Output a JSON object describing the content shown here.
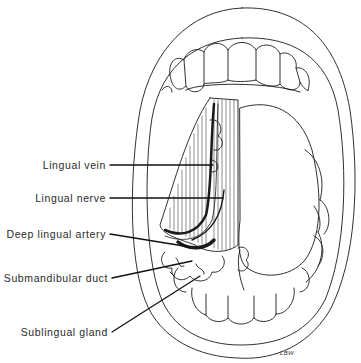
{
  "figure": {
    "labels": [
      {
        "id": "lingual-vein",
        "text": "Lingual vein"
      },
      {
        "id": "lingual-nerve",
        "text": "Lingual nerve"
      },
      {
        "id": "deep-lingual-artery",
        "text": "Deep lingual artery"
      },
      {
        "id": "submandibular-duct",
        "text": "Submandibular duct"
      },
      {
        "id": "sublingual-gland",
        "text": "Sublingual gland"
      }
    ],
    "signature": "LBW",
    "colors": {
      "ink": "#1a1a1a",
      "background": "#ffffff",
      "label_text": "#2a2a2a"
    }
  }
}
